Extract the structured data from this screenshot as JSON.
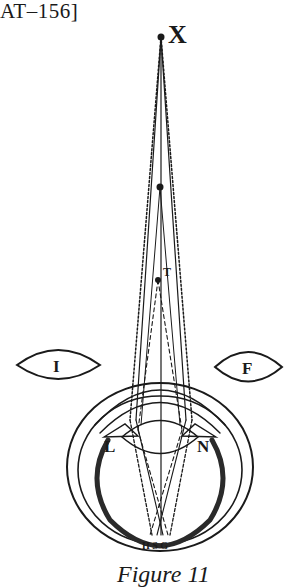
{
  "page": {
    "header_ref": "AT–156]",
    "caption": "Figure 11"
  },
  "figure": {
    "labels": {
      "X": "X",
      "T": "T",
      "I": "I",
      "F": "F",
      "L": "L",
      "N": "N",
      "HSG": "H S G"
    },
    "ink_color": "#1a1a1a",
    "background": "#ffffff"
  }
}
